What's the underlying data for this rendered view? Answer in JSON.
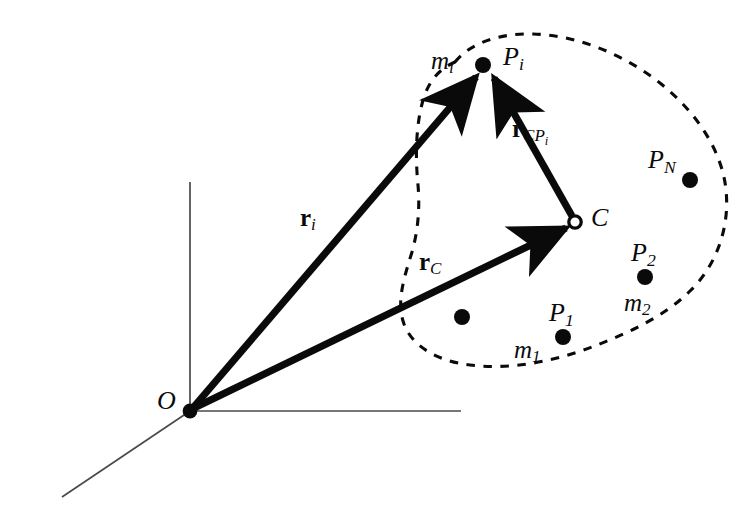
{
  "figure": {
    "background_color": "#ffffff",
    "ink_color": "#0a0a0a",
    "axis_color": "#4a4a4a",
    "boundary_style": "dashed"
  },
  "points": {
    "origin": {
      "label": "O",
      "sub": "",
      "x": 190,
      "y": 411,
      "marker": "filled-dot"
    },
    "center_of_mass": {
      "label": "C",
      "sub": "",
      "x": 575,
      "y": 222,
      "marker": "hollow-circle"
    },
    "particle_i": {
      "label": "P",
      "sub": "i",
      "mass_label": "m",
      "mass_sub": "i",
      "x": 483,
      "y": 65,
      "marker": "filled-dot"
    },
    "particle_1": {
      "label": "P",
      "sub": "1",
      "mass_label": "m",
      "mass_sub": "1",
      "x": 563,
      "y": 337,
      "marker": "filled-dot"
    },
    "particle_2": {
      "label": "P",
      "sub": "2",
      "mass_label": "m",
      "mass_sub": "2",
      "x": 645,
      "y": 277,
      "marker": "filled-dot"
    },
    "particle_N": {
      "label": "P",
      "sub": "N",
      "mass_label": "",
      "mass_sub": "",
      "x": 690,
      "y": 180,
      "marker": "filled-dot"
    },
    "particle_unlabeled": {
      "label": "",
      "sub": "",
      "x": 462,
      "y": 317,
      "marker": "filled-dot"
    }
  },
  "vectors": [
    {
      "name": "r_i",
      "symbol": "r",
      "sub": "i",
      "from": "origin",
      "to": "particle_i",
      "label_x": 300,
      "label_y": 205
    },
    {
      "name": "r_C",
      "symbol": "r",
      "sub": "C",
      "from": "origin",
      "to": "center_of_mass",
      "label_x": 420,
      "label_y": 250
    },
    {
      "name": "r_CPi",
      "symbol": "r",
      "sub": "CP",
      "sub2": "i",
      "from": "center_of_mass",
      "to": "particle_i",
      "label_x": 515,
      "label_y": 117
    }
  ],
  "axes": [
    {
      "name": "vertical-axis",
      "x1": 190,
      "y1": 411,
      "x2": 190,
      "y2": 182
    },
    {
      "name": "horizontal-axis",
      "x1": 190,
      "y1": 411,
      "x2": 461,
      "y2": 411
    },
    {
      "name": "diagonal-axis",
      "x1": 190,
      "y1": 411,
      "x2": 62,
      "y2": 497
    }
  ],
  "labels": {
    "origin_label": "O",
    "center_label": "C",
    "p_i": "P",
    "p_i_sub": "i",
    "m_i": "m",
    "m_i_sub": "i",
    "p_1": "P",
    "p_1_sub": "1",
    "m_1": "m",
    "m_1_sub": "1",
    "p_2": "P",
    "p_2_sub": "2",
    "m_2": "m",
    "m_2_sub": "2",
    "p_N": "P",
    "p_N_sub": "N",
    "r_i_symbol": "r",
    "r_i_sub": "i",
    "r_C_symbol": "r",
    "r_C_sub": "C",
    "r_CP_symbol": "r",
    "r_CP_sub": "CP",
    "r_CP_sub2": "i"
  }
}
